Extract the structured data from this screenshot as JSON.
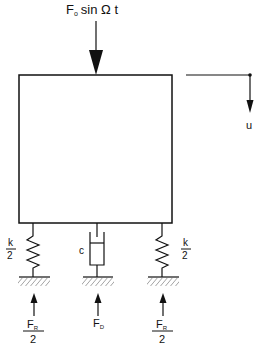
{
  "diagram": {
    "colors": {
      "stroke": "#111111",
      "background": "#ffffff",
      "hatch": "#333333"
    },
    "excitation": {
      "symbol": "F",
      "subscript": "o",
      "rest": "sin Ω t"
    },
    "displacement": {
      "label": "u"
    },
    "spring_left": {
      "num": "k",
      "den": "2"
    },
    "spring_right": {
      "num": "k",
      "den": "2"
    },
    "damper": {
      "label": "c"
    },
    "reaction_left": {
      "symbol": "F",
      "subscript": "R",
      "den": "2"
    },
    "reaction_center": {
      "symbol": "F",
      "subscript": "D"
    },
    "reaction_right": {
      "symbol": "F",
      "subscript": "R",
      "den": "2"
    }
  }
}
